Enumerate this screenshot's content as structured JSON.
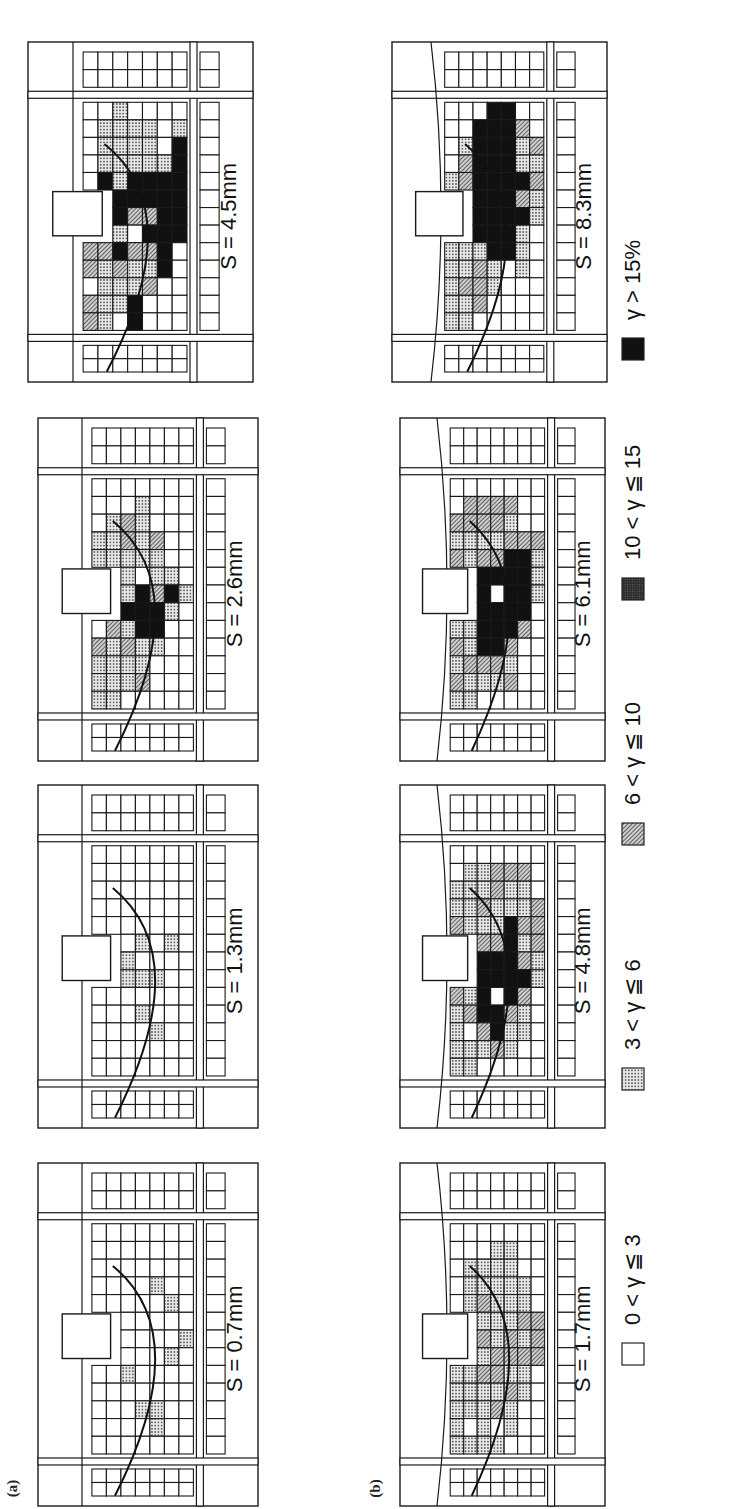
{
  "figure": {
    "row_labels": [
      "(a)",
      "(b)"
    ],
    "caption_visible": "Japanese Society of Soil Mechanics and Foundation",
    "legend": [
      {
        "label": "0 < γ ≦ 3",
        "fill": "white"
      },
      {
        "label": "3 < γ ≦ 6",
        "fill": "dots"
      },
      {
        "label": "6 < γ ≦ 10",
        "fill": "hatch"
      },
      {
        "label": "10 < γ ≦ 15",
        "fill": "dark"
      },
      {
        "label": "γ > 15%",
        "fill": "black"
      }
    ]
  },
  "chart_data": {
    "type": "heatmap",
    "orientation": "figure rotated 90° counter-clockwise on page",
    "legend": [
      "0<γ≦3",
      "3<γ≦6",
      "6<γ≦10",
      "10<γ≦15",
      "γ>15%"
    ],
    "rows": [
      {
        "label": "(a)",
        "panels": [
          {
            "S": "S = 0.7mm",
            "settlement_mm": 0.7,
            "dominant": "0<γ≦3",
            "notes": "few dotted cells along slip arc"
          },
          {
            "S": "S = 1.3mm",
            "settlement_mm": 1.3,
            "dominant": "0<γ≦3",
            "notes": "dotted cells along slip arc"
          },
          {
            "S": "S = 2.6mm",
            "settlement_mm": 2.6,
            "dominant": "mixed",
            "notes": "black band forming under footing"
          },
          {
            "S": "S = 4.5mm",
            "settlement_mm": 4.5,
            "dominant": "γ>15%",
            "notes": "continuous black slip band"
          }
        ]
      },
      {
        "label": "(b)",
        "panels": [
          {
            "S": "S = 1.7mm",
            "settlement_mm": 1.7,
            "dominant": "3<γ≦6",
            "notes": "dotted/hatched region along arc"
          },
          {
            "S": "S = 4.8mm",
            "settlement_mm": 4.8,
            "dominant": "mixed",
            "notes": "black zone under footing"
          },
          {
            "S": "S = 6.1mm",
            "settlement_mm": 6.1,
            "dominant": "γ>15%",
            "notes": "enlarged black zone"
          },
          {
            "S": "S = 8.3mm",
            "settlement_mm": 8.3,
            "dominant": "γ>15%",
            "notes": "wide continuous black band"
          }
        ]
      }
    ]
  },
  "panels": [
    {
      "id": "a1",
      "row": "a",
      "label": "S = 0.7mm",
      "x": 38,
      "y": 1163,
      "w": 220,
      "h": 343,
      "curved_edge": false,
      "cells": "0000000000000|0000000000000|0000100000000|0010000000000|0110000001000|0000010010000|0000001000000|0000000000000"
    },
    {
      "id": "a2",
      "row": "a",
      "label": "S = 1.3mm",
      "x": 38,
      "y": 785,
      "w": 220,
      "h": 343,
      "curved_edge": false,
      "cells": "0000000000000|0000000000000|0000011000000|0001010100000|0010010000000|0000000100000|0000000000000|0000000000000"
    },
    {
      "id": "a3",
      "row": "a",
      "label": "S = 2.6mm",
      "x": 38,
      "y": 418,
      "w": 220,
      "h": 343,
      "curved_edge": false,
      "cells": "1112022111000|1111211111100|0112141112200|0211444011110|0001442112000|0000014100000|0000001000000|0000000000000"
    },
    {
      "id": "a4",
      "row": "a",
      "label": "S = 4.5mm",
      "x": 28,
      "y": 42,
      "w": 225,
      "h": 340,
      "curved_edge": false,
      "cells": "2202221400000|1111214441110|0112414411111|4411202441110|0021242441110|0004444441000|0000044444410|0000000000000"
    },
    {
      "id": "b1",
      "row": "b",
      "label": "S = 1.7mm",
      "x": 400,
      "y": 1163,
      "w": 205,
      "h": 343,
      "curved_edge": true,
      "cells": "1111110000000|1011111111100|1111212121100|1021221111110|0112122111110|0001121211000|0000022200000|0000000000000"
    },
    {
      "id": "b2",
      "row": "b",
      "label": "S = 4.8mm",
      "x": 400,
      "y": 785,
      "w": 205,
      "h": 343,
      "curved_edge": true,
      "cells": "1111222121100|1102121211110|0124444212110|0244044211220|0112444441120|0011242121120|0000011222000|0000000000000"
    },
    {
      "id": "b3",
      "row": "b",
      "label": "S = 6.1mm",
      "x": 400,
      "y": 418,
      "w": 205,
      "h": 343,
      "curved_edge": true,
      "cells": "1212122121200|1121121211220|0124444421220|0124440421220|0212444442120|0000244442000|0000001112000|0000000000000"
    },
    {
      "id": "b4",
      "row": "b",
      "label": "S = 8.3mm",
      "x": 392,
      "y": 42,
      "w": 215,
      "h": 340,
      "curved_edge": true,
      "cells": "1111111110000|1121111222100|0222144444440|0011444444444|0000444444444|0001114241120|0000001121200|0000000000000"
    }
  ]
}
